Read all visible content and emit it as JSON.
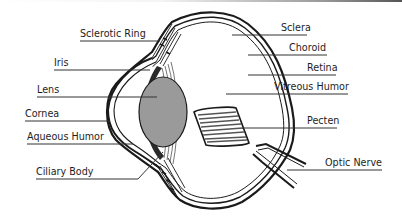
{
  "diagram": {
    "labels_left": [
      {
        "id": "sclerotic-ring",
        "text": "Sclerotic Ring"
      },
      {
        "id": "iris",
        "text": "Iris"
      },
      {
        "id": "lens",
        "text": "Lens"
      },
      {
        "id": "cornea",
        "text": "Cornea"
      },
      {
        "id": "aqueous-humor",
        "text": "Aqueous Humor"
      },
      {
        "id": "ciliary-body",
        "text": "Ciliary Body"
      }
    ],
    "labels_right": [
      {
        "id": "sclera",
        "text": "Sclera"
      },
      {
        "id": "choroid",
        "text": "Choroid"
      },
      {
        "id": "retina",
        "text": "Retina"
      },
      {
        "id": "vitreous-humor",
        "text": "Vitreous Humor"
      },
      {
        "id": "pecten",
        "text": "Pecten"
      },
      {
        "id": "optic-nerve",
        "text": "Optic Nerve"
      }
    ],
    "colors": {
      "lens_fill": "#9a9a9a",
      "outline": "#1a1a1a",
      "iris_fill": "#2a2a2a",
      "background": "#ffffff"
    }
  }
}
